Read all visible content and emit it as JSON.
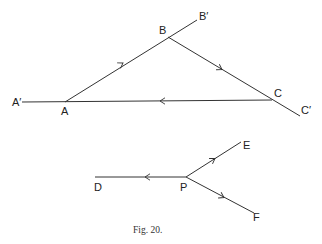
{
  "figure": {
    "caption": "Fig. 20.",
    "colors": {
      "background": "#ffffff",
      "ink": "#333333"
    },
    "top_diagram": {
      "description": "Triangle ABC with sides produced to A', B', C'; arrows indicate A to B, B to C, C to A",
      "points": {
        "A_prime": {
          "label": "A′",
          "x": 22,
          "y": 102
        },
        "A": {
          "label": "A",
          "x": 65,
          "y": 102
        },
        "B": {
          "label": "B",
          "x": 168,
          "y": 37
        },
        "B_prime": {
          "label": "B′",
          "x": 197,
          "y": 20
        },
        "C": {
          "label": "C",
          "x": 272,
          "y": 100
        },
        "C_prime": {
          "label": "C′",
          "x": 300,
          "y": 116
        }
      },
      "segments": [
        {
          "from": "A_prime",
          "to": "C",
          "arrow_direction": "toward A"
        },
        {
          "from": "A",
          "to": "B_prime",
          "arrow_direction": "toward B"
        },
        {
          "from": "B",
          "to": "C_prime",
          "arrow_direction": "toward C"
        }
      ]
    },
    "bottom_diagram": {
      "description": "Point P with three forces: toward D, toward E, toward F",
      "points": {
        "D": {
          "label": "D",
          "x": 95,
          "y": 177
        },
        "P": {
          "label": "P",
          "x": 186,
          "y": 177
        },
        "E": {
          "label": "E",
          "x": 241,
          "y": 142
        },
        "F": {
          "label": "F",
          "x": 254,
          "y": 213
        }
      },
      "segments": [
        {
          "from": "P",
          "to": "D",
          "arrow_direction": "toward D"
        },
        {
          "from": "P",
          "to": "E",
          "arrow_direction": "toward E"
        },
        {
          "from": "P",
          "to": "F",
          "arrow_direction": "toward F"
        }
      ]
    }
  }
}
